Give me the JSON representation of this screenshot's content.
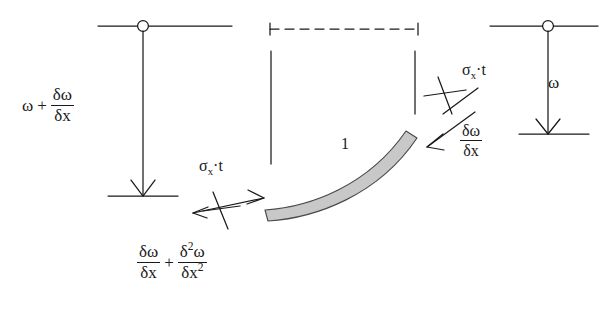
{
  "diagram": {
    "colors": {
      "stroke": "#1a1a1a",
      "beam_fill": "#c8c8c8",
      "beam_stroke": "#4a4a4a",
      "background": "#ffffff"
    },
    "labels": {
      "left_load": {
        "name": "left-distributed-load",
        "omega": "ω",
        "plus": "+",
        "fraction_numerator": "δω",
        "fraction_denominator": "δx"
      },
      "right_load": {
        "name": "right-distributed-load",
        "omega": "ω"
      },
      "sigma_left": {
        "name": "axial-stress-left",
        "sigma": "σ",
        "subscript": "x",
        "dot": "·",
        "thickness": "t"
      },
      "sigma_right": {
        "name": "axial-stress-right",
        "sigma": "σ",
        "subscript": "x",
        "dot": "·",
        "thickness": "t"
      },
      "slope_right": {
        "name": "slope-right",
        "numerator": "δω",
        "denominator": "δx"
      },
      "bottom_expression": {
        "name": "slope-plus-curvature",
        "first_numerator": "δω",
        "first_denominator": "δx",
        "plus": "+",
        "second_numerator_delta": "δ",
        "second_numerator_power": "2",
        "second_numerator_omega": "ω",
        "second_denominator_base": "δx",
        "second_denominator_power": "2"
      },
      "element_number": {
        "name": "element-number",
        "text": "1"
      }
    },
    "elements": {
      "left_support_node": "pin-node-circle",
      "right_support_node": "pin-node-circle",
      "left_load_arrow": "downward-arrow",
      "right_load_arrow": "downward-arrow",
      "dashed_reference_line": "dashed-horizontal-line",
      "left_vertical_tick": "vertical-reference-line",
      "right_vertical_tick": "vertical-reference-line",
      "curved_beam": "curved-beam-element",
      "left_force_marker": "double-headed-arrow-with-cross",
      "right_force_marker": "diagonal-arrow-with-cross"
    }
  }
}
